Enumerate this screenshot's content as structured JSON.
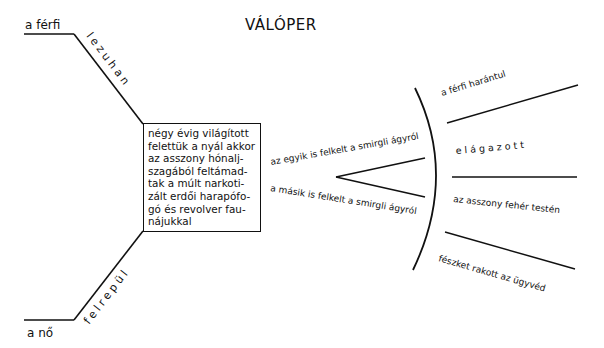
{
  "title": "VÁLÓPER",
  "left_branches": {
    "top": {
      "subject": "a férfi",
      "verb": "lezuhan"
    },
    "bottom": {
      "subject": "a nő",
      "verb": "felrepül"
    }
  },
  "center_box": {
    "lines": [
      "négy évig világított",
      "felettük a nyál akkor",
      "az asszony hónalj-",
      "szagából feltámad-",
      "tak a múlt narkoti-",
      "zált erdői harapófo-",
      "gó és revolver fau-",
      "nájukkal"
    ]
  },
  "fork": {
    "upper": "az egyik is felkelt a smirgli ágyról",
    "lower": "a másik is felkelt a smirgli ágyról"
  },
  "right_fan": [
    "a férfi harántul",
    "elágazott",
    "az asszony fehér testén",
    "fészket rakott az ügyvéd"
  ],
  "colors": {
    "ink": "#111111",
    "background": "#ffffff"
  }
}
